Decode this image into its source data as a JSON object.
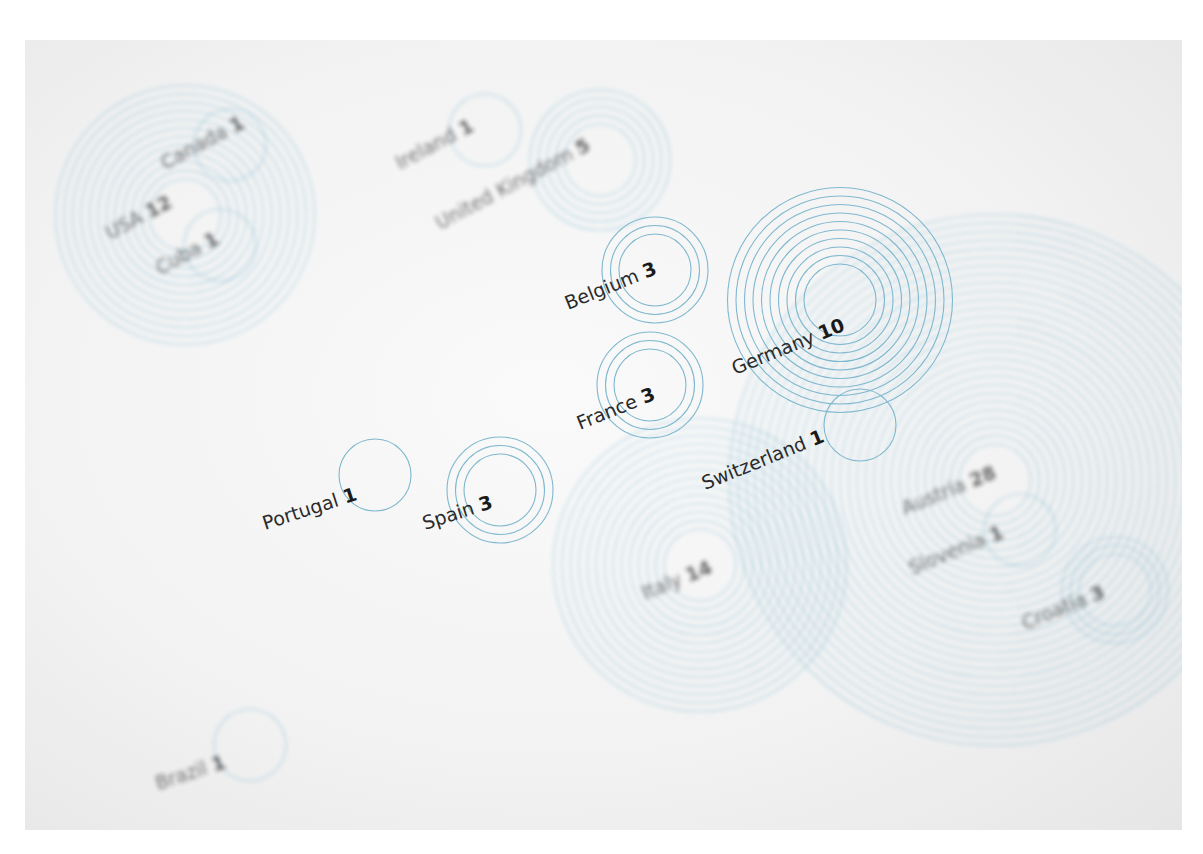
{
  "colors": {
    "ring": "#7fb8d0",
    "paper": "#f4f4f4",
    "text": "#2a2a2a"
  },
  "chart_data": {
    "type": "bubble-concentric",
    "title": "",
    "points": [
      {
        "country": "Canada",
        "value": 1,
        "cx": 230,
        "cy": 145,
        "angle": -28,
        "lx": 165,
        "ly": 170,
        "blur": true
      },
      {
        "country": "USA",
        "value": 12,
        "cx": 185,
        "cy": 215,
        "angle": -28,
        "lx": 110,
        "ly": 240,
        "blur": true
      },
      {
        "country": "Cuba",
        "value": 1,
        "cx": 220,
        "cy": 245,
        "angle": -28,
        "lx": 160,
        "ly": 275,
        "blur": true
      },
      {
        "country": "Ireland",
        "value": 1,
        "cx": 485,
        "cy": 130,
        "angle": -28,
        "lx": 400,
        "ly": 170,
        "blur": true
      },
      {
        "country": "United Kingdom",
        "value": 5,
        "cx": 600,
        "cy": 160,
        "angle": -28,
        "lx": 440,
        "ly": 230,
        "blur": true
      },
      {
        "country": "Belgium",
        "value": 3,
        "cx": 655,
        "cy": 270,
        "angle": -22,
        "lx": 568,
        "ly": 310,
        "blur": false
      },
      {
        "country": "Germany",
        "value": 10,
        "cx": 840,
        "cy": 300,
        "angle": -22,
        "lx": 735,
        "ly": 375,
        "blur": false
      },
      {
        "country": "France",
        "value": 3,
        "cx": 650,
        "cy": 385,
        "angle": -22,
        "lx": 580,
        "ly": 430,
        "blur": false
      },
      {
        "country": "Switzerland",
        "value": 1,
        "cx": 860,
        "cy": 425,
        "angle": -22,
        "lx": 705,
        "ly": 490,
        "blur": false
      },
      {
        "country": "Portugal",
        "value": 1,
        "cx": 375,
        "cy": 475,
        "angle": -18,
        "lx": 265,
        "ly": 530,
        "blur": false
      },
      {
        "country": "Spain",
        "value": 3,
        "cx": 500,
        "cy": 490,
        "angle": -18,
        "lx": 425,
        "ly": 530,
        "blur": false
      },
      {
        "country": "Italy",
        "value": 14,
        "cx": 700,
        "cy": 565,
        "angle": -22,
        "lx": 645,
        "ly": 600,
        "blur": true
      },
      {
        "country": "Austria",
        "value": 28,
        "cx": 995,
        "cy": 480,
        "angle": -22,
        "lx": 905,
        "ly": 515,
        "blur": true
      },
      {
        "country": "Slovenia",
        "value": 1,
        "cx": 1020,
        "cy": 530,
        "angle": -22,
        "lx": 912,
        "ly": 575,
        "blur": true
      },
      {
        "country": "Croatia",
        "value": 3,
        "cx": 1115,
        "cy": 590,
        "angle": -22,
        "lx": 1025,
        "ly": 630,
        "blur": true
      },
      {
        "country": "Brazil",
        "value": 1,
        "cx": 250,
        "cy": 745,
        "angle": -18,
        "lx": 158,
        "ly": 790,
        "blur": true
      }
    ],
    "xlabel": "",
    "ylabel": "",
    "legend": "none",
    "grid": false
  }
}
